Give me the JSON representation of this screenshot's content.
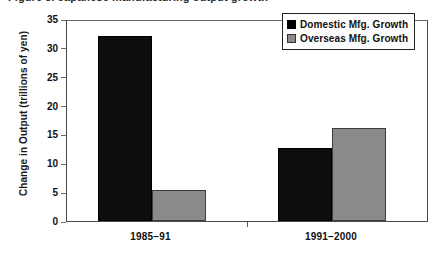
{
  "figure": {
    "cut_off_caption": "Figure 3. Japanese manufacturing output growth"
  },
  "chart_data": {
    "type": "bar",
    "title": "",
    "xlabel": "",
    "ylabel": "Change in Output  (trillions of yen)",
    "categories": [
      "1985–91",
      "1991–2000"
    ],
    "series": [
      {
        "name": "Domestic Mfg. Growth",
        "color": "#000000",
        "values": [
          32,
          12.7
        ]
      },
      {
        "name": "Overseas Mfg. Growth",
        "color": "#8a8a8a",
        "values": [
          5.3,
          16.2
        ]
      }
    ],
    "ylim": [
      0,
      35
    ],
    "yticks": [
      0,
      5,
      10,
      15,
      20,
      25,
      30,
      35
    ],
    "ytick_labels": [
      "0",
      "5",
      "10",
      "15",
      "20",
      "25",
      "30",
      "35"
    ],
    "grid": false,
    "legend_position": "top-right-inside"
  }
}
